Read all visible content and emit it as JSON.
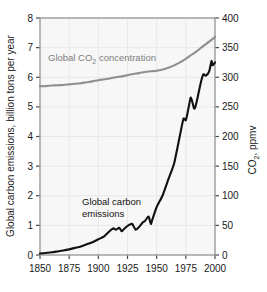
{
  "chart_data": {
    "type": "line",
    "title": "",
    "xlabel": "",
    "xlim": [
      1850,
      2000
    ],
    "xticks": [
      1850,
      1875,
      1900,
      1925,
      1950,
      1975,
      2000
    ],
    "xtick_labels": [
      "1850",
      "1875",
      "1900",
      "1925",
      "1950",
      "1975",
      "2000"
    ],
    "grid": true,
    "legend": "inline annotations",
    "left_axis": {
      "label": "Global carbon emissions, billion tons per year",
      "ylim": [
        0,
        8
      ],
      "yticks": [
        0,
        1,
        2,
        3,
        4,
        5,
        6,
        7,
        8
      ],
      "ytick_labels": [
        "0",
        "1",
        "2",
        "3",
        "4",
        "5",
        "6",
        "7",
        "8"
      ],
      "color": "#111111"
    },
    "right_axis": {
      "label": "CO2, ppmv",
      "label_main": "CO",
      "label_sub": "2",
      "label_tail": ", ppmv",
      "ylim": [
        0,
        400
      ],
      "yticks": [
        0,
        50,
        100,
        150,
        200,
        250,
        300,
        350,
        400
      ],
      "ytick_labels": [
        "0",
        "50",
        "100",
        "150",
        "200",
        "250",
        "300",
        "350",
        "400"
      ],
      "color": "#111111"
    },
    "series": [
      {
        "name": "Global CO2 concentration",
        "axis": "right",
        "unit": "ppmv",
        "color": "#8f8f8f",
        "annotation": "Global CO2 concentration",
        "annotation_main": "Global CO",
        "annotation_sub": "2",
        "annotation_tail": " concentration",
        "x": [
          1850,
          1855,
          1860,
          1865,
          1870,
          1875,
          1880,
          1885,
          1890,
          1895,
          1900,
          1905,
          1910,
          1915,
          1920,
          1925,
          1930,
          1935,
          1940,
          1945,
          1950,
          1955,
          1960,
          1965,
          1970,
          1975,
          1980,
          1985,
          1990,
          1995,
          2000
        ],
        "values": [
          285,
          285,
          286,
          286.5,
          287,
          288,
          289,
          290,
          291.5,
          293,
          295,
          296.5,
          298,
          300,
          301.5,
          303.5,
          305.5,
          307,
          309,
          310,
          311,
          313,
          316,
          320,
          325,
          331,
          338,
          345,
          353,
          360,
          368
        ]
      },
      {
        "name": "Global carbon emissions",
        "axis": "left",
        "unit": "billion tons per year",
        "color": "#111111",
        "annotation": "Global carbon emissions",
        "annotation_line1": "Global carbon",
        "annotation_line2": "emissions",
        "x": [
          1850,
          1855,
          1860,
          1865,
          1870,
          1875,
          1880,
          1885,
          1890,
          1895,
          1900,
          1905,
          1910,
          1913,
          1915,
          1918,
          1920,
          1922,
          1925,
          1927,
          1929,
          1932,
          1935,
          1938,
          1940,
          1943,
          1945,
          1946,
          1950,
          1955,
          1960,
          1965,
          1970,
          1973,
          1975,
          1977,
          1979,
          1980,
          1982,
          1983,
          1985,
          1988,
          1990,
          1992,
          1995,
          1997,
          1998,
          2000
        ],
        "values": [
          0.05,
          0.07,
          0.09,
          0.12,
          0.15,
          0.19,
          0.24,
          0.29,
          0.36,
          0.43,
          0.53,
          0.63,
          0.82,
          0.9,
          0.85,
          0.92,
          0.8,
          0.88,
          0.98,
          1.03,
          1.05,
          0.85,
          0.95,
          1.1,
          1.15,
          1.3,
          1.05,
          1.16,
          1.62,
          2.0,
          2.55,
          3.1,
          4.05,
          4.6,
          4.55,
          4.9,
          5.3,
          5.25,
          4.95,
          4.98,
          5.3,
          5.85,
          6.1,
          6.05,
          6.2,
          6.55,
          6.4,
          6.5
        ]
      }
    ]
  },
  "figure": {
    "background": "#ffffff",
    "plot_background": "#f7f7f7",
    "frame_color": "#9a9a9a",
    "gridline_color": "#e8e8e8"
  }
}
